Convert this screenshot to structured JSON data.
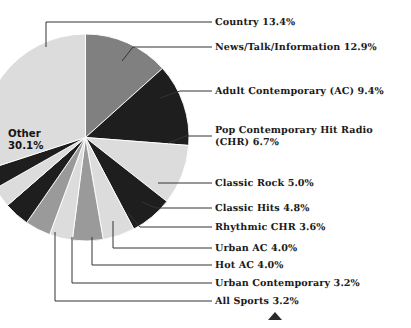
{
  "chart_data": {
    "type": "pie",
    "title": "",
    "subtitle": "",
    "xlabel": "",
    "ylabel": "",
    "legend_position": "callout-labels-right",
    "grid": false,
    "units": "percent",
    "start_angle_deg": -90,
    "direction": "clockwise",
    "categories": [
      "Country",
      "News/Talk/Information",
      "Adult Contemporary (AC)",
      "Pop Contemporary Hit Radio (CHR)",
      "Classic Rock",
      "Classic Hits",
      "Rhythmic CHR",
      "Urban AC",
      "Hot AC",
      "Urban Contemporary",
      "All Sports",
      "Other"
    ],
    "values": [
      13.4,
      12.9,
      9.4,
      6.7,
      5.0,
      4.8,
      3.6,
      4.0,
      4.0,
      3.2,
      3.2,
      30.1
    ],
    "slice_colors": [
      "#808080",
      "#1e1e1e",
      "#dcdcdc",
      "#1e1e1e",
      "#dcdcdc",
      "#9a9a9a",
      "#dcdcdc",
      "#9a9a9a",
      "#1e1e1e",
      "#dcdcdc",
      "#1e1e1e",
      "#dcdcdc"
    ]
  },
  "slices": [
    {
      "label": "Country 13.4%",
      "name": "Country",
      "value": 13.4,
      "color": "#808080"
    },
    {
      "label": "News/Talk/Information 12.9%",
      "name": "News/Talk/Information",
      "value": 12.9,
      "color": "#1e1e1e"
    },
    {
      "label": "Adult Contemporary (AC) 9.4%",
      "name": "Adult Contemporary (AC)",
      "value": 9.4,
      "color": "#dcdcdc"
    },
    {
      "label": "Pop Contemporary Hit Radio\n(CHR) 6.7%",
      "name": "Pop Contemporary Hit Radio (CHR)",
      "value": 6.7,
      "color": "#1e1e1e"
    },
    {
      "label": "Classic Rock 5.0%",
      "name": "Classic Rock",
      "value": 5.0,
      "color": "#dcdcdc"
    },
    {
      "label": "Classic Hits 4.8%",
      "name": "Classic Hits",
      "value": 4.8,
      "color": "#9a9a9a"
    },
    {
      "label": "Rhythmic CHR 3.6%",
      "name": "Rhythmic CHR",
      "value": 3.6,
      "color": "#dcdcdc"
    },
    {
      "label": "Urban AC 4.0%",
      "name": "Urban AC",
      "value": 4.0,
      "color": "#9a9a9a"
    },
    {
      "label": "Hot AC 4.0%",
      "name": "Hot AC",
      "value": 4.0,
      "color": "#1e1e1e"
    },
    {
      "label": "Urban Contemporary 3.2%",
      "name": "Urban Contemporary",
      "value": 3.2,
      "color": "#dcdcdc"
    },
    {
      "label": "All Sports 3.2%",
      "name": "All Sports",
      "value": 3.2,
      "color": "#1e1e1e"
    }
  ],
  "inner_label": {
    "text": "Other\n30.1%",
    "name": "Other",
    "value": 30.1
  },
  "marker": {
    "name": "triangle-marker",
    "color": "#2b2b2b"
  },
  "colors": {
    "background": "#ffffff",
    "text": "#1b1b1b",
    "leader_line": "#333333",
    "dark_slice": "#1e1e1e",
    "mid_slice": "#808080",
    "mid2_slice": "#9a9a9a",
    "light_slice": "#dcdcdc"
  }
}
